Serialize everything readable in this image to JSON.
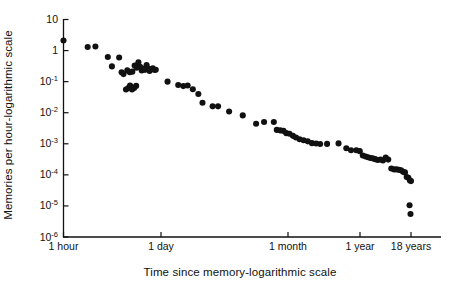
{
  "figure": {
    "background": "#ffffff",
    "ink": "#111111",
    "marker_color": "#111111"
  },
  "chart_data": {
    "type": "scatter",
    "title": "",
    "subtitle": "",
    "xlabel": "Time since memory-logarithmic scale",
    "ylabel": "Memories per hour-logarithmic scale",
    "x_scale": "log",
    "y_scale": "log",
    "grid": false,
    "legend": null,
    "annotations": [],
    "x_tick_labels": [
      "1 hour",
      "1 day",
      "1 month",
      "1 year",
      "18 years"
    ],
    "x_tick_hours": [
      1,
      24,
      720,
      8760,
      157680
    ],
    "y_tick_labels": [
      "10",
      "1",
      "10⁻¹",
      "10⁻²",
      "10⁻³",
      "10⁻´",
      "10⁻⁵",
      "10⁻⁶"
    ],
    "y_tick_values": [
      10,
      1,
      0.1,
      0.01,
      0.001,
      0.0001,
      1e-05,
      1e-06
    ],
    "ylim": [
      1e-06,
      10
    ],
    "xlim_hours": [
      1,
      200000
    ],
    "x_unit": "hours since memory",
    "y_unit": "memories recalled per hour",
    "point_count": 88,
    "points": [
      {
        "x_hours": 1.0,
        "y": 2.1
      },
      {
        "x_hours": 2.3,
        "y": 1.3
      },
      {
        "x_hours": 3.0,
        "y": 1.35
      },
      {
        "x_hours": 4.6,
        "y": 0.62
      },
      {
        "x_hours": 5.3,
        "y": 0.31
      },
      {
        "x_hours": 6.8,
        "y": 0.6
      },
      {
        "x_hours": 7.4,
        "y": 0.2
      },
      {
        "x_hours": 7.9,
        "y": 0.175
      },
      {
        "x_hours": 8.6,
        "y": 0.056
      },
      {
        "x_hours": 9.3,
        "y": 0.062
      },
      {
        "x_hours": 9.9,
        "y": 0.075
      },
      {
        "x_hours": 10.6,
        "y": 0.056
      },
      {
        "x_hours": 11.4,
        "y": 0.063
      },
      {
        "x_hours": 12.2,
        "y": 0.073
      },
      {
        "x_hours": 9.0,
        "y": 0.23
      },
      {
        "x_hours": 9.8,
        "y": 0.2
      },
      {
        "x_hours": 10.7,
        "y": 0.21
      },
      {
        "x_hours": 11.6,
        "y": 0.33
      },
      {
        "x_hours": 12.4,
        "y": 0.28
      },
      {
        "x_hours": 13.2,
        "y": 0.42
      },
      {
        "x_hours": 14.0,
        "y": 0.3
      },
      {
        "x_hours": 14.8,
        "y": 0.23
      },
      {
        "x_hours": 15.7,
        "y": 0.26
      },
      {
        "x_hours": 16.6,
        "y": 0.24
      },
      {
        "x_hours": 17.5,
        "y": 0.34
      },
      {
        "x_hours": 18.4,
        "y": 0.26
      },
      {
        "x_hours": 19.4,
        "y": 0.22
      },
      {
        "x_hours": 20.5,
        "y": 0.25
      },
      {
        "x_hours": 21.6,
        "y": 0.27
      },
      {
        "x_hours": 22.8,
        "y": 0.24
      },
      {
        "x_hours": 24.0,
        "y": 0.24
      },
      {
        "x_hours": 36.0,
        "y": 0.1
      },
      {
        "x_hours": 52.0,
        "y": 0.078
      },
      {
        "x_hours": 62.0,
        "y": 0.072
      },
      {
        "x_hours": 72.0,
        "y": 0.075
      },
      {
        "x_hours": 86.0,
        "y": 0.057
      },
      {
        "x_hours": 104.0,
        "y": 0.04
      },
      {
        "x_hours": 120.0,
        "y": 0.021
      },
      {
        "x_hours": 170.0,
        "y": 0.016
      },
      {
        "x_hours": 205.0,
        "y": 0.016
      },
      {
        "x_hours": 300.0,
        "y": 0.011
      },
      {
        "x_hours": 480.0,
        "y": 0.0082
      },
      {
        "x_hours": 760.0,
        "y": 0.0044
      },
      {
        "x_hours": 1000.0,
        "y": 0.005
      },
      {
        "x_hours": 1400.0,
        "y": 0.005
      },
      {
        "x_hours": 1550.0,
        "y": 0.0028
      },
      {
        "x_hours": 1750.0,
        "y": 0.0027
      },
      {
        "x_hours": 1950.0,
        "y": 0.0026
      },
      {
        "x_hours": 2150.0,
        "y": 0.0022
      },
      {
        "x_hours": 2400.0,
        "y": 0.0021
      },
      {
        "x_hours": 2700.0,
        "y": 0.0018
      },
      {
        "x_hours": 3000.0,
        "y": 0.0016
      },
      {
        "x_hours": 3400.0,
        "y": 0.0014
      },
      {
        "x_hours": 3900.0,
        "y": 0.0013
      },
      {
        "x_hours": 4500.0,
        "y": 0.0012
      },
      {
        "x_hours": 5200.0,
        "y": 0.00105
      },
      {
        "x_hours": 6000.0,
        "y": 0.00102
      },
      {
        "x_hours": 6900.0,
        "y": 0.00098
      },
      {
        "x_hours": 8760.0,
        "y": 0.00099
      },
      {
        "x_hours": 13000.0,
        "y": 0.00103
      },
      {
        "x_hours": 17000.0,
        "y": 0.00072
      },
      {
        "x_hours": 20000.0,
        "y": 0.00062
      },
      {
        "x_hours": 24000.0,
        "y": 0.00062
      },
      {
        "x_hours": 27000.0,
        "y": 0.00058
      },
      {
        "x_hours": 30000.0,
        "y": 0.00042
      },
      {
        "x_hours": 33000.0,
        "y": 0.00039
      },
      {
        "x_hours": 36000.0,
        "y": 0.00037
      },
      {
        "x_hours": 39000.0,
        "y": 0.00035
      },
      {
        "x_hours": 42000.0,
        "y": 0.00034
      },
      {
        "x_hours": 46000.0,
        "y": 0.00032
      },
      {
        "x_hours": 50000.0,
        "y": 0.0003
      },
      {
        "x_hours": 55000.0,
        "y": 0.00031
      },
      {
        "x_hours": 60000.0,
        "y": 0.00029
      },
      {
        "x_hours": 66000.0,
        "y": 0.00036
      },
      {
        "x_hours": 72000.0,
        "y": 0.00031
      },
      {
        "x_hours": 80000.0,
        "y": 0.00016
      },
      {
        "x_hours": 88000.0,
        "y": 0.00015
      },
      {
        "x_hours": 96000.0,
        "y": 0.00015
      },
      {
        "x_hours": 104000.0,
        "y": 0.000145
      },
      {
        "x_hours": 112000.0,
        "y": 0.00014
      },
      {
        "x_hours": 120000.0,
        "y": 0.000125
      },
      {
        "x_hours": 128000.0,
        "y": 0.00012
      },
      {
        "x_hours": 136000.0,
        "y": 8.5e-05
      },
      {
        "x_hours": 144000.0,
        "y": 8e-05
      },
      {
        "x_hours": 152000.0,
        "y": 6.6e-05
      },
      {
        "x_hours": 157680.0,
        "y": 6.3e-05
      },
      {
        "x_hours": 150000.0,
        "y": 1.05e-05
      },
      {
        "x_hours": 155000.0,
        "y": 5.5e-06
      }
    ]
  },
  "axes": {
    "y_title": "Memories per hour-logarithmic scale",
    "x_title": "Time since memory-logarithmic scale",
    "y_ticks": [
      {
        "label_main": "10",
        "label_exp": ""
      },
      {
        "label_main": "1",
        "label_exp": ""
      },
      {
        "label_main": "10",
        "label_exp": "-1"
      },
      {
        "label_main": "10",
        "label_exp": "-2"
      },
      {
        "label_main": "10",
        "label_exp": "-3"
      },
      {
        "label_main": "10",
        "label_exp": "-4"
      },
      {
        "label_main": "10",
        "label_exp": "-5"
      },
      {
        "label_main": "10",
        "label_exp": "-6"
      }
    ],
    "x_ticks": [
      {
        "label": "1 hour"
      },
      {
        "label": "1 day"
      },
      {
        "label": "1 month"
      },
      {
        "label": "1 year"
      },
      {
        "label": "18 years"
      }
    ]
  }
}
